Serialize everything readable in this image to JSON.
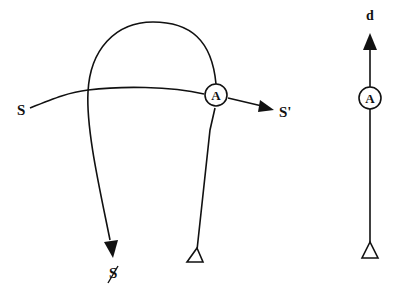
{
  "diagram": {
    "left_figure": {
      "labels": {
        "source": "S",
        "target": "S'",
        "negated_target": "S̸",
        "node": "A"
      },
      "edges": [
        {
          "from": "S",
          "via": "A",
          "to": "S'",
          "arrow": "filled"
        },
        {
          "from": "root",
          "via": "A",
          "to": "S̸",
          "shape": "arch-loop",
          "arrow": "filled"
        }
      ],
      "root_symbol": "open-triangle"
    },
    "right_figure": {
      "labels": {
        "top": "d",
        "node": "A"
      },
      "edges": [
        {
          "from": "root",
          "via": "A",
          "to": "d",
          "arrow": "filled"
        }
      ],
      "root_symbol": "open-triangle"
    }
  }
}
